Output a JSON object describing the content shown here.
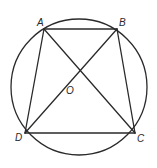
{
  "diagram": {
    "type": "inscribed-quadrilateral",
    "stroke_color": "#2a2a2a",
    "background": "#ffffff",
    "circle": {
      "cx": 79,
      "cy": 87,
      "r": 68
    },
    "points": {
      "A": {
        "x": 44,
        "y": 29,
        "label": "A",
        "label_x": 37,
        "label_y": 26
      },
      "B": {
        "x": 117,
        "y": 29,
        "label": "B",
        "label_x": 119,
        "label_y": 26
      },
      "C": {
        "x": 135,
        "y": 133,
        "label": "C",
        "label_x": 137,
        "label_y": 142
      },
      "D": {
        "x": 25,
        "y": 133,
        "label": "D",
        "label_x": 15,
        "label_y": 141
      },
      "O": {
        "x": 79,
        "y": 89,
        "label": "O",
        "label_x": 66,
        "label_y": 94
      }
    },
    "segments": [
      {
        "from": "A",
        "to": "B"
      },
      {
        "from": "B",
        "to": "C"
      },
      {
        "from": "C",
        "to": "D"
      },
      {
        "from": "D",
        "to": "A"
      },
      {
        "from": "A",
        "to": "C"
      },
      {
        "from": "B",
        "to": "D"
      }
    ]
  }
}
